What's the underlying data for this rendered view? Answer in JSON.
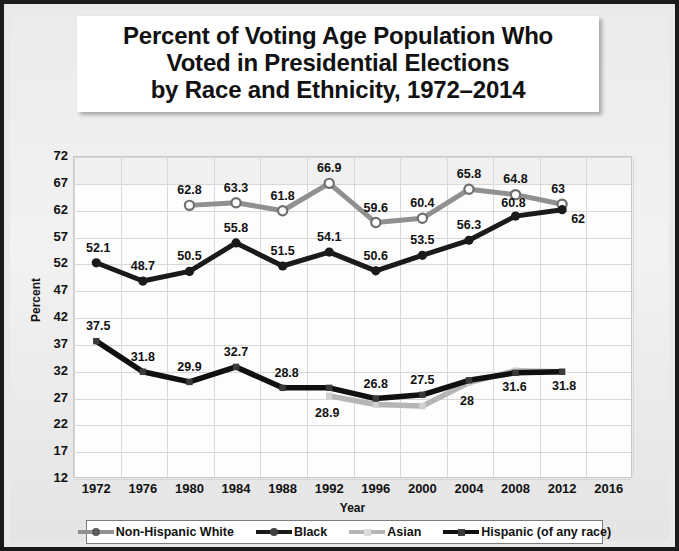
{
  "chart_data": {
    "type": "line",
    "title": "Percent of Voting Age Population Who Voted in Presidential Elections by Race and Ethnicity, 1972–2014",
    "title_lines": [
      "Percent of Voting Age Population Who",
      "Voted in Presidential Elections",
      "by Race and Ethnicity, 1972–2014"
    ],
    "xlabel": "Year",
    "ylabel": "Percent",
    "grid": true,
    "legend_position": "bottom",
    "xlim": [
      1972,
      2016
    ],
    "ylim": [
      12,
      72
    ],
    "yticks": [
      72,
      67,
      62,
      57,
      52,
      47,
      42,
      37,
      32,
      27,
      22,
      17,
      12
    ],
    "categories": [
      1972,
      1976,
      1980,
      1984,
      1988,
      1992,
      1996,
      2000,
      2004,
      2008,
      2012,
      2016
    ],
    "series": [
      {
        "name": "Non-Hispanic White",
        "color": "#909090",
        "marker": "circle-open",
        "x": [
          1980,
          1984,
          1988,
          1992,
          1996,
          2000,
          2004,
          2008,
          2012
        ],
        "values": [
          62.8,
          63.3,
          61.8,
          66.9,
          59.6,
          60.4,
          65.8,
          64.8,
          63.0
        ],
        "labels": [
          "62.8",
          "63.3",
          "61.8",
          "66.9",
          "59.6",
          "60.4",
          "65.8",
          "64.8",
          "63"
        ]
      },
      {
        "name": "Black",
        "color": "#1a1a1a",
        "marker": "circle-filled",
        "x": [
          1972,
          1976,
          1980,
          1984,
          1988,
          1992,
          1996,
          2000,
          2004,
          2008,
          2012
        ],
        "values": [
          52.1,
          48.7,
          50.5,
          55.8,
          51.5,
          54.1,
          50.6,
          53.5,
          56.3,
          60.8,
          62.0
        ],
        "labels": [
          "52.1",
          "48.7",
          "50.5",
          "55.8",
          "51.5",
          "54.1",
          "50.6",
          "53.5",
          "56.3",
          "60.8",
          "62"
        ]
      },
      {
        "name": "Asian",
        "color": "#b5b5b5",
        "marker": "square",
        "x": [
          1992,
          1996,
          2000,
          2004,
          2008,
          2012
        ],
        "values": [
          27.3,
          25.7,
          25.4,
          29.8,
          32.0,
          31.8
        ],
        "labels": [
          "28.9",
          "",
          "",
          "28",
          "",
          ""
        ]
      },
      {
        "name": "Hispanic (of any race)",
        "color": "#101010",
        "marker": "square",
        "x": [
          1972,
          1976,
          1980,
          1984,
          1988,
          1992,
          1996,
          2000,
          2004,
          2008,
          2012
        ],
        "values": [
          37.5,
          31.8,
          29.9,
          32.7,
          28.8,
          28.8,
          26.8,
          27.5,
          30.2,
          31.6,
          31.8
        ],
        "labels": [
          "37.5",
          "31.8",
          "29.9",
          "32.7",
          "28.8",
          "",
          "26.8",
          "27.5",
          "",
          "31.6",
          "31.8"
        ]
      }
    ],
    "point_labels": [
      {
        "text": "62.8",
        "x": 1980,
        "y": 62.8,
        "dx": 0,
        "dy": -15
      },
      {
        "text": "63.3",
        "x": 1984,
        "y": 63.3,
        "dx": 0,
        "dy": -15
      },
      {
        "text": "61.8",
        "x": 1988,
        "y": 61.8,
        "dx": 0,
        "dy": -15
      },
      {
        "text": "66.9",
        "x": 1992,
        "y": 66.9,
        "dx": 0,
        "dy": -15
      },
      {
        "text": "59.6",
        "x": 1996,
        "y": 59.6,
        "dx": 0,
        "dy": -15
      },
      {
        "text": "60.4",
        "x": 2000,
        "y": 60.4,
        "dx": 0,
        "dy": -15
      },
      {
        "text": "65.8",
        "x": 2004,
        "y": 65.8,
        "dx": 0,
        "dy": -15
      },
      {
        "text": "64.8",
        "x": 2008,
        "y": 64.8,
        "dx": 0,
        "dy": -16
      },
      {
        "text": "63",
        "x": 2012,
        "y": 63.0,
        "dx": -4,
        "dy": -15
      },
      {
        "text": "52.1",
        "x": 1972,
        "y": 52.1,
        "dx": 2,
        "dy": -15
      },
      {
        "text": "48.7",
        "x": 1976,
        "y": 48.7,
        "dx": 0,
        "dy": -15
      },
      {
        "text": "50.5",
        "x": 1980,
        "y": 50.5,
        "dx": 0,
        "dy": -15
      },
      {
        "text": "55.8",
        "x": 1984,
        "y": 55.8,
        "dx": 0,
        "dy": -15
      },
      {
        "text": "51.5",
        "x": 1988,
        "y": 51.5,
        "dx": 0,
        "dy": -15
      },
      {
        "text": "54.1",
        "x": 1992,
        "y": 54.1,
        "dx": 0,
        "dy": -15
      },
      {
        "text": "50.6",
        "x": 1996,
        "y": 50.6,
        "dx": 0,
        "dy": -15
      },
      {
        "text": "53.5",
        "x": 2000,
        "y": 53.5,
        "dx": 0,
        "dy": -15
      },
      {
        "text": "56.3",
        "x": 2004,
        "y": 56.3,
        "dx": 0,
        "dy": -15
      },
      {
        "text": "60.8",
        "x": 2008,
        "y": 60.8,
        "dx": -2,
        "dy": -13
      },
      {
        "text": "62",
        "x": 2012,
        "y": 62.0,
        "dx": 16,
        "dy": 9
      },
      {
        "text": "37.5",
        "x": 1972,
        "y": 37.5,
        "dx": 2,
        "dy": -15
      },
      {
        "text": "31.8",
        "x": 1976,
        "y": 31.8,
        "dx": 0,
        "dy": -15
      },
      {
        "text": "29.9",
        "x": 1980,
        "y": 29.9,
        "dx": 0,
        "dy": -15
      },
      {
        "text": "32.7",
        "x": 1984,
        "y": 32.7,
        "dx": 0,
        "dy": -15
      },
      {
        "text": "28.8",
        "x": 1988,
        "y": 28.8,
        "dx": 4,
        "dy": -15
      },
      {
        "text": "28.9",
        "x": 1992,
        "y": 27.3,
        "dx": -2,
        "dy": 17
      },
      {
        "text": "26.8",
        "x": 1996,
        "y": 26.8,
        "dx": 0,
        "dy": -15
      },
      {
        "text": "27.5",
        "x": 2000,
        "y": 27.5,
        "dx": 0,
        "dy": -15
      },
      {
        "text": "28",
        "x": 2004,
        "y": 29.8,
        "dx": -2,
        "dy": 19
      },
      {
        "text": "31.6",
        "x": 2008,
        "y": 31.6,
        "dx": -1,
        "dy": 14
      },
      {
        "text": "31.8",
        "x": 2012,
        "y": 31.8,
        "dx": 2,
        "dy": 14
      }
    ]
  },
  "legend": {
    "items": [
      {
        "label": "Non-Hispanic White",
        "color": "#909090",
        "marker": "circle-open"
      },
      {
        "label": "Black",
        "color": "#1a1a1a",
        "marker": "circle-filled"
      },
      {
        "label": "Asian",
        "color": "#b5b5b5",
        "marker": "square"
      },
      {
        "label": "Hispanic (of any race)",
        "color": "#101010",
        "marker": "square"
      }
    ]
  }
}
